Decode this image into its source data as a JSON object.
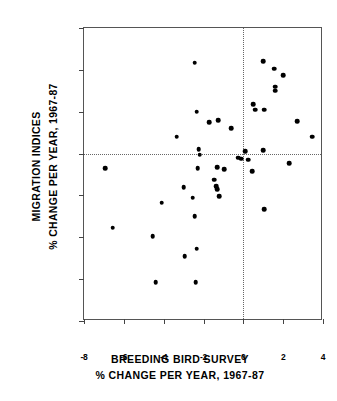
{
  "chart_data": {
    "type": "scatter",
    "title": "",
    "xlabel": "BREEDING BIRD SURVEY % CHANGE PER YEAR, 1967-87",
    "ylabel": "MIGRATION INDICES % CHANGE PER YEAR, 1967-87",
    "xlim": [
      -8,
      4
    ],
    "ylim": [
      -8,
      6
    ],
    "xticks": [
      -8,
      -6,
      -4,
      -2,
      0,
      2,
      4
    ],
    "yticks": [
      6,
      4,
      2,
      0,
      -2,
      -4,
      -6,
      -8
    ],
    "xtick_labels": [
      "-8",
      "-6",
      "-4",
      "-2",
      "0",
      "2",
      "4"
    ],
    "ytick_labels": [
      "6",
      "4",
      "2",
      "0",
      "-2",
      "-4",
      "-6",
      "-8"
    ],
    "grid": false,
    "legend": null,
    "reference_lines": {
      "vertical_x": 0,
      "horizontal_y": 0,
      "style": "dotted"
    },
    "marker": {
      "shape": "circle",
      "color": "#000000",
      "size": 4.6
    },
    "points": [
      [
        -6.95,
        -0.7
      ],
      [
        -6.55,
        -3.55
      ],
      [
        -4.55,
        -3.95
      ],
      [
        -4.4,
        -6.15
      ],
      [
        -4.1,
        -2.35
      ],
      [
        -3.35,
        0.8
      ],
      [
        -3.0,
        -1.6
      ],
      [
        -2.95,
        -4.9
      ],
      [
        -2.55,
        -2.1
      ],
      [
        -2.45,
        4.35
      ],
      [
        -2.45,
        -3.0
      ],
      [
        -2.4,
        -6.15
      ],
      [
        -2.35,
        2.0
      ],
      [
        -2.35,
        -4.55
      ],
      [
        -2.3,
        -0.7
      ],
      [
        -2.25,
        0.2
      ],
      [
        -2.2,
        -0.05
      ],
      [
        -1.7,
        1.5
      ],
      [
        -1.45,
        -1.25
      ],
      [
        -1.35,
        -1.55
      ],
      [
        -1.3,
        -1.7
      ],
      [
        -1.3,
        -0.65
      ],
      [
        -1.25,
        1.6
      ],
      [
        -1.2,
        -2.05
      ],
      [
        -0.95,
        -0.75
      ],
      [
        -0.6,
        1.2
      ],
      [
        -0.25,
        -0.2
      ],
      [
        -0.1,
        -0.25
      ],
      [
        0.1,
        0.1
      ],
      [
        0.25,
        -0.3
      ],
      [
        0.45,
        -0.85
      ],
      [
        0.5,
        2.35
      ],
      [
        0.6,
        2.1
      ],
      [
        1.0,
        4.4
      ],
      [
        1.0,
        0.15
      ],
      [
        1.05,
        2.1
      ],
      [
        1.05,
        -2.65
      ],
      [
        1.55,
        4.05
      ],
      [
        1.6,
        3.2
      ],
      [
        1.6,
        3.0
      ],
      [
        2.0,
        3.75
      ],
      [
        2.3,
        -0.45
      ],
      [
        2.7,
        1.55
      ],
      [
        3.45,
        0.8
      ]
    ]
  },
  "axis_titles": {
    "y_line1": "MIGRATION INDICES",
    "y_line2": "% CHANGE PER YEAR, 1967-87",
    "x_line1": "BREEDING BIRD SURVEY",
    "x_line2": "% CHANGE PER YEAR, 1967-87"
  }
}
